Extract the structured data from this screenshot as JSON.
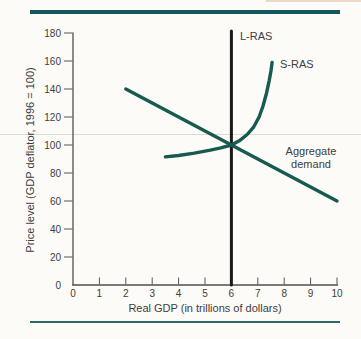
{
  "page": {
    "background_color": "#fcfbf8",
    "accent_teal": "#14585c",
    "bottom_rule_color": "#2a6b64",
    "text_color": "#3d3d3d",
    "axis_color": "#4f4f4f"
  },
  "chart_data": {
    "type": "line",
    "title": "",
    "xlabel": "Real GDP (in trillions of dollars)",
    "ylabel": "Price level (GDP deflator, 1996 = 100)",
    "xlim": [
      0,
      10
    ],
    "ylim": [
      0,
      180
    ],
    "x_ticks": [
      0,
      1,
      2,
      3,
      4,
      5,
      6,
      7,
      8,
      9,
      10
    ],
    "y_ticks": [
      0,
      20,
      40,
      60,
      80,
      100,
      120,
      140,
      160,
      180
    ],
    "grid": false,
    "legend": "inline-labels",
    "equilibrium": {
      "x": 6,
      "y": 100
    },
    "series": [
      {
        "name": "L-RAS",
        "label": "L-RAS",
        "kind": "vertical-line",
        "color": "#1a1a1a",
        "width": 3,
        "points": [
          [
            6,
            0
          ],
          [
            6,
            181.5
          ]
        ]
      },
      {
        "name": "S-RAS",
        "label": "S-RAS",
        "kind": "curve",
        "color": "#175a50",
        "width": 3.4,
        "points": [
          [
            3.5,
            91.5
          ],
          [
            4.0,
            92.5
          ],
          [
            4.6,
            94.2
          ],
          [
            5.2,
            96.3
          ],
          [
            5.6,
            98
          ],
          [
            6,
            100
          ],
          [
            6.3,
            103
          ],
          [
            6.6,
            107.5
          ],
          [
            6.85,
            113
          ],
          [
            7.05,
            120
          ],
          [
            7.2,
            128
          ],
          [
            7.33,
            137
          ],
          [
            7.43,
            146
          ],
          [
            7.5,
            153
          ],
          [
            7.54,
            159
          ]
        ]
      },
      {
        "name": "Aggregate demand",
        "label": "Aggregate demand",
        "kind": "line",
        "color": "#175a50",
        "width": 3.4,
        "points": [
          [
            2,
            140
          ],
          [
            10,
            60
          ]
        ]
      }
    ]
  }
}
